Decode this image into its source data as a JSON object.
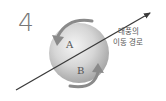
{
  "problem_number": "4",
  "labels": {
    "a": "A",
    "b": "B"
  },
  "path_label": {
    "line1": "태풍의",
    "line2": "이동 경로"
  },
  "colors": {
    "sphere_light": "#f2f2f2",
    "sphere_mid": "#cfcfcf",
    "sphere_dark": "#9a9a9a",
    "arrow": "#8a8a8a",
    "path_line": "#3a3a3a",
    "text": "#555555",
    "number": "#777777"
  }
}
